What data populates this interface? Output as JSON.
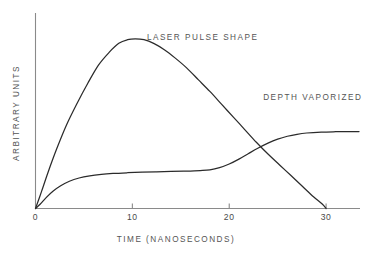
{
  "chart_data": {
    "type": "line",
    "title": "",
    "xlabel": "TIME  (NANOSECONDS)",
    "ylabel": "ARBITRARY UNITS",
    "xticklabels": [
      "0",
      "10",
      "20",
      "30"
    ],
    "xtickvalues": [
      0,
      10,
      20,
      30
    ],
    "yticklabels": [],
    "xlim": [
      0,
      33.5
    ],
    "ylim": [
      0,
      1.0
    ],
    "grid": false,
    "legend": "inline-annotations",
    "annotations": [
      {
        "text": "LASER PULSE SHAPE",
        "x": 11.5,
        "y": 0.93
      },
      {
        "text": "DEPTH VAPORIZED",
        "x": 23.5,
        "y": 0.6
      }
    ],
    "series": [
      {
        "name": "LASER PULSE SHAPE",
        "x": [
          0,
          0.6,
          1.3,
          2.2,
          3.2,
          4.3,
          5.4,
          6.5,
          7.6,
          8.6,
          9.5,
          10.3,
          11.2,
          12.2,
          13.3,
          14.4,
          15.6,
          16.8,
          18.0,
          19.2,
          20.4,
          21.6,
          22.8,
          24.0,
          25.2,
          26.4,
          27.6,
          28.7,
          29.6,
          30.0
        ],
        "y": [
          0.0,
          0.09,
          0.2,
          0.33,
          0.46,
          0.58,
          0.69,
          0.79,
          0.86,
          0.91,
          0.93,
          0.935,
          0.93,
          0.91,
          0.875,
          0.83,
          0.775,
          0.71,
          0.645,
          0.575,
          0.505,
          0.435,
          0.365,
          0.3,
          0.24,
          0.18,
          0.12,
          0.065,
          0.025,
          0.0
        ]
      },
      {
        "name": "DEPTH VAPORIZED",
        "x": [
          0,
          0.5,
          1.1,
          1.8,
          2.6,
          3.5,
          4.5,
          5.6,
          6.8,
          8.0,
          9.5,
          11.0,
          12.5,
          14.0,
          15.5,
          17.0,
          18.0,
          19.0,
          20.0,
          21.0,
          22.0,
          23.0,
          24.0,
          25.0,
          26.0,
          27.0,
          28.0,
          29.5,
          31.0,
          32.5,
          33.4
        ],
        "y": [
          0.0,
          0.025,
          0.06,
          0.095,
          0.125,
          0.15,
          0.168,
          0.18,
          0.188,
          0.193,
          0.197,
          0.2,
          0.202,
          0.204,
          0.206,
          0.209,
          0.213,
          0.225,
          0.245,
          0.272,
          0.303,
          0.333,
          0.36,
          0.382,
          0.398,
          0.409,
          0.416,
          0.421,
          0.423,
          0.424,
          0.424
        ]
      }
    ]
  },
  "labels": {
    "laser_pulse": "LASER PULSE SHAPE",
    "depth_vaporized": "DEPTH VAPORIZED",
    "x_axis_title": "TIME  (NANOSECONDS)",
    "y_axis_title": "ARBITRARY UNITS",
    "tick_0": "0",
    "tick_10": "10",
    "tick_20": "20",
    "tick_30": "30"
  },
  "colors": {
    "curve": "#2b2b2b",
    "axis": "#8a8a8a",
    "text": "#555555",
    "background": "#ffffff"
  }
}
